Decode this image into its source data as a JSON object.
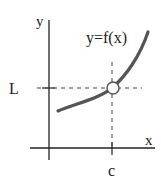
{
  "diagram": {
    "type": "limit-illustration",
    "curve_label": "y=f(x)",
    "y_axis_label": "y",
    "x_axis_label": "x",
    "limit_value_label": "L",
    "approach_point_label": "c",
    "hole_description": "open circle at (c, L)",
    "colors": {
      "axes": "#222222",
      "curve": "#555555",
      "dashes": "#444444",
      "text": "#222222",
      "hole_fill": "#ffffff"
    }
  }
}
